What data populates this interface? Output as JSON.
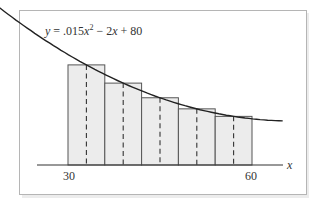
{
  "chart_data": {
    "type": "bar",
    "subtype": "riemann-midpoint-rectangles-with-curve",
    "title": "",
    "equation_label": {
      "y": "y",
      "equals": " = .015",
      "x1": "x",
      "exp": "2",
      "minus": " − 2",
      "x2": "x",
      "plus": " + 80"
    },
    "function": {
      "a": 0.015,
      "b": -2,
      "c": 80
    },
    "xlabel": "x",
    "ylabel": "",
    "x_tick_labels": [
      "30",
      "60"
    ],
    "xlim": [
      30,
      60
    ],
    "grid": false,
    "legend": "none",
    "bar_width": 6,
    "categories": [
      "[30,36]",
      "[36,42]",
      "[42,48]",
      "[48,54]",
      "[54,60]"
    ],
    "midpoints": [
      33,
      39,
      45,
      51,
      57
    ],
    "values": [
      30.335,
      24.815,
      20.375,
      17.015,
      14.735
    ],
    "curve_x_range": [
      16,
      65
    ]
  }
}
